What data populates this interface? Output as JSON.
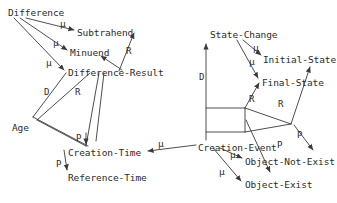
{
  "diagram": {
    "canvas": {
      "width": 337,
      "height": 203
    },
    "stroke_color": "#3a3a3a",
    "text_color": "#2b2b2b",
    "background_color": "#ffffff",
    "nodes": [
      {
        "id": "difference",
        "label": "Difference",
        "x": 8,
        "y": 8
      },
      {
        "id": "subtrahend",
        "label": "Subtrahend",
        "x": 77,
        "y": 28
      },
      {
        "id": "minuend",
        "label": "Minuend",
        "x": 70,
        "y": 48
      },
      {
        "id": "difference-result",
        "label": "Difference-Result",
        "x": 68,
        "y": 68
      },
      {
        "id": "age",
        "label": "Age",
        "x": 12,
        "y": 123
      },
      {
        "id": "creation-time",
        "label": "Creation-Time",
        "x": 68,
        "y": 148
      },
      {
        "id": "reference-time",
        "label": "Reference-Time",
        "x": 68,
        "y": 173
      },
      {
        "id": "state-change",
        "label": "State-Change",
        "x": 210,
        "y": 30
      },
      {
        "id": "initial-state",
        "label": "Initial-State",
        "x": 263,
        "y": 55
      },
      {
        "id": "final-state",
        "label": "Final-State",
        "x": 262,
        "y": 78
      },
      {
        "id": "creation-event",
        "label": "Creation-Event",
        "x": 198,
        "y": 143
      },
      {
        "id": "object-not-exist",
        "label": "Object-Not-Exist",
        "x": 245,
        "y": 157
      },
      {
        "id": "object-exist",
        "label": "Object-Exist",
        "x": 245,
        "y": 180
      }
    ],
    "edge_labels": [
      {
        "id": "mu-diff-subtrahend",
        "label": "µ",
        "x": 60,
        "y": 19
      },
      {
        "id": "mu-diff-minuend",
        "label": "µ",
        "x": 53,
        "y": 38
      },
      {
        "id": "mu-diff-difference-result",
        "label": "µ",
        "x": 46,
        "y": 58
      },
      {
        "id": "r-minuend",
        "label": "R",
        "x": 126,
        "y": 47
      },
      {
        "id": "d-age",
        "label": "D",
        "x": 44,
        "y": 88
      },
      {
        "id": "r-age",
        "label": "R",
        "x": 75,
        "y": 88
      },
      {
        "id": "p-creation-time",
        "label": "P",
        "x": 76,
        "y": 134
      },
      {
        "id": "p-reference-time",
        "label": "P",
        "x": 56,
        "y": 160
      },
      {
        "id": "mu-creation-time-event",
        "label": "µ",
        "x": 158,
        "y": 139
      },
      {
        "id": "mu-sc-initial",
        "label": "µ",
        "x": 253,
        "y": 43
      },
      {
        "id": "mu-sc-final",
        "label": "µ",
        "x": 249,
        "y": 57
      },
      {
        "id": "d-state-change",
        "label": "D",
        "x": 199,
        "y": 73
      },
      {
        "id": "r-final-state",
        "label": "R",
        "x": 249,
        "y": 95
      },
      {
        "id": "r-initial-state",
        "label": "R",
        "x": 278,
        "y": 100
      },
      {
        "id": "p-object-not-exist",
        "label": "P",
        "x": 297,
        "y": 131
      },
      {
        "id": "p-object-exist",
        "label": "P",
        "x": 277,
        "y": 141
      },
      {
        "id": "mu-ce-not-exist",
        "label": "µ",
        "x": 230,
        "y": 150
      },
      {
        "id": "mu-ce-exist",
        "label": "µ",
        "x": 219,
        "y": 167
      }
    ],
    "edges": [
      {
        "id": "difference-to-subtrahend",
        "from": "Difference",
        "to": "Subtrahend",
        "relation": "µ",
        "path": "M 22 17 L 73 30"
      },
      {
        "id": "difference-to-minuend",
        "from": "Difference",
        "to": "Minuend",
        "relation": "µ",
        "path": "M 17 17 L 66 50"
      },
      {
        "id": "difference-to-difference-result",
        "from": "Difference",
        "to": "Difference-Result",
        "relation": "µ",
        "path": "M 12 17 L 64 70"
      },
      {
        "id": "difference-result-to-minuend",
        "from": "Difference-Result",
        "to": "Minuend",
        "relation": "R",
        "path": "M 119 70 L 99 55"
      },
      {
        "id": "minuend-to-subtrahend",
        "from": "Minuend",
        "to": "Subtrahend",
        "relation": "R",
        "path": "M 116 70 L 133 32"
      },
      {
        "id": "age-to-difference-result",
        "from": "Age",
        "to": "Difference-Result",
        "relation": "D",
        "path": "M 33 118 L 64 72"
      },
      {
        "id": "age-to-difference-result-r",
        "from": "Age",
        "to": "Difference-Result",
        "relation": "R",
        "path": "M 36 121 L 83 72"
      },
      {
        "id": "creation-time-to-diffresult-d",
        "from": "Creation-Time",
        "to": "Difference-Result",
        "relation": "D",
        "path": "M 84 142 L 57 97"
      },
      {
        "id": "creation-time-to-diffresult-r",
        "from": "Creation-Time",
        "to": "Difference-Result",
        "relation": "R",
        "path": "M 90 140 L 86 96"
      },
      {
        "id": "age-to-creation-time",
        "from": "Age",
        "to": "Creation-Time",
        "relation": "P",
        "path": "M 86 132 L 86 146"
      },
      {
        "id": "age-to-reference-time",
        "from": "Age",
        "to": "Reference-Time",
        "relation": "P",
        "path": "M 63 150 L 66 172"
      },
      {
        "id": "creation-event-to-creation-time",
        "from": "Creation-Event",
        "to": "Creation-Time",
        "relation": "µ",
        "path": "M 196 146 L 146 151"
      },
      {
        "id": "state-change-to-initial-state",
        "from": "State-Change",
        "to": "Initial-State",
        "relation": "µ",
        "path": "M 243 40 L 261 56"
      },
      {
        "id": "state-change-to-final-state",
        "from": "State-Change",
        "to": "Final-State",
        "relation": "µ",
        "path": "M 236 40 L 259 79"
      },
      {
        "id": "creation-event-to-state-change",
        "from": "Creation-Event",
        "to": "State-Change",
        "relation": "D",
        "path": "M 206 140 L 206 42"
      },
      {
        "id": "final-state-to-initial-state",
        "from": "Final-State",
        "to": "Initial-State",
        "relation": "R",
        "path": "M 289 125 L 309 68"
      },
      {
        "id": "hinge-to-final-state",
        "from": "Creation-Event",
        "to": "Final-State",
        "relation": "R",
        "path": "M 243 118 L 259 82"
      },
      {
        "id": "hinge-to-object-not-exist",
        "from": "Creation-Event",
        "to": "Object-Not-Exist",
        "relation": "P",
        "path": "M 292 124 L 312 151"
      },
      {
        "id": "hinge-to-object-exist",
        "from": "Creation-Event",
        "to": "Object-Exist",
        "relation": "P",
        "path": "M 246 122 L 268 174"
      },
      {
        "id": "creation-event-to-obj-not-exist",
        "from": "Creation-Event",
        "to": "Object-Not-Exist",
        "relation": "µ",
        "path": "M 218 148 L 241 159"
      },
      {
        "id": "creation-event-to-obj-exist",
        "from": "Creation-Event",
        "to": "Object-Exist",
        "relation": "µ",
        "path": "M 211 148 L 241 182"
      }
    ]
  }
}
